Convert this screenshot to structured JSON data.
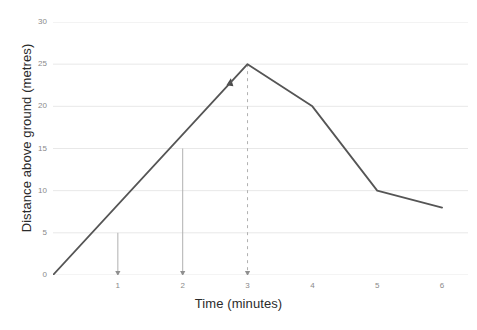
{
  "chart_data": {
    "type": "line",
    "title": "",
    "xlabel": "Time (minutes)",
    "ylabel": "Distance above ground (metres)",
    "xlim": [
      0,
      6.4
    ],
    "ylim": [
      0,
      30
    ],
    "grid": true,
    "legend": null,
    "x_ticks": [
      "1",
      "2",
      "3",
      "4",
      "5",
      "6"
    ],
    "x_tick_values": [
      1,
      2,
      3,
      4,
      5,
      6
    ],
    "y_ticks": [
      "0",
      "5",
      "10",
      "15",
      "20",
      "25",
      "30"
    ],
    "y_tick_values": [
      0,
      5,
      10,
      15,
      20,
      25,
      30
    ],
    "series": [
      {
        "name": "Distance above ground",
        "color": "#555555",
        "x": [
          0,
          3,
          4,
          5,
          6
        ],
        "y": [
          0,
          25,
          20,
          10,
          8
        ]
      }
    ],
    "annotations": [
      {
        "name": "drop-line-1",
        "x": 1,
        "y_from": 5,
        "y_to": 0,
        "style": "solid",
        "arrow": "down"
      },
      {
        "name": "drop-line-2",
        "x": 2,
        "y_from": 15,
        "y_to": 0,
        "style": "solid",
        "arrow": "down"
      },
      {
        "name": "drop-line-3",
        "x": 3,
        "y_from": 25,
        "y_to": 0,
        "style": "dashed",
        "arrow": "down"
      },
      {
        "name": "peak-arrow",
        "x": 2.72,
        "y": 23.2,
        "style": "arrow-up"
      }
    ],
    "colors": {
      "line": "#555555",
      "grid": "#e8e8e8",
      "tick_text": "#8a8a8a",
      "axis_title": "#2b2b2b",
      "annotation": "#b0b0b0",
      "background": "#ffffff"
    }
  }
}
